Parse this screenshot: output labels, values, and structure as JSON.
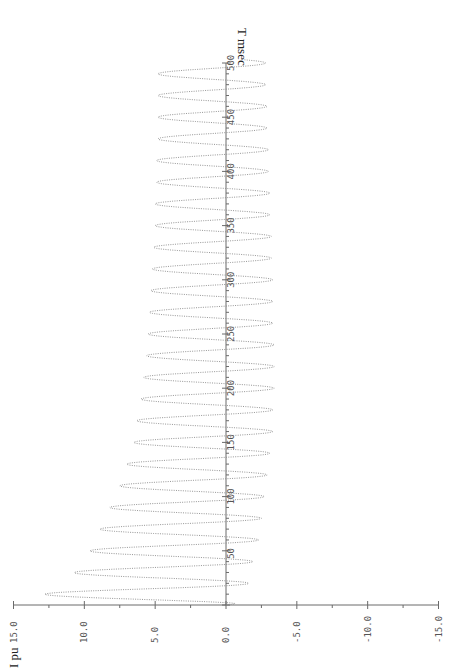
{
  "chart_data": {
    "type": "line",
    "orientation": "rotated-90 (time axis vertical upward, current axis horizontal with positive to the left)",
    "title": "",
    "xlabel": "T msec",
    "ylabel": "I pu",
    "xlim": [
      0,
      500
    ],
    "ylim": [
      -15,
      15
    ],
    "x_ticks": [
      50,
      100,
      150,
      200,
      250,
      300,
      350,
      400,
      450,
      500
    ],
    "x_tick_labels": [
      "50",
      "100",
      "150",
      "200",
      "250",
      "300",
      "350",
      "400",
      "450",
      "500"
    ],
    "y_ticks": [
      15,
      10,
      5,
      0,
      -5,
      -10,
      -15
    ],
    "y_tick_labels": [
      "15.0",
      "10.0",
      "5.0",
      "0.0",
      "-5.0",
      "-10.0",
      "-15.0"
    ],
    "grid": false,
    "legend": null,
    "line_style": "dotted",
    "frequency_hz": 50,
    "series": [
      {
        "name": "I",
        "positive_peaks": {
          "t": [
            10,
            30,
            50,
            70,
            90,
            110,
            130,
            150,
            170,
            190,
            210,
            230,
            250,
            270,
            290,
            310,
            330,
            350,
            370,
            390,
            410,
            430,
            450,
            470,
            490
          ],
          "i": [
            12.8,
            10.7,
            9.6,
            8.9,
            8.2,
            7.5,
            7.0,
            6.5,
            6.3,
            6.0,
            5.8,
            5.6,
            5.5,
            5.4,
            5.3,
            5.2,
            5.1,
            5.0,
            5.0,
            4.9,
            4.9,
            4.8,
            4.8,
            4.8,
            4.8
          ]
        },
        "negative_peaks": {
          "t": [
            20,
            40,
            60,
            80,
            100,
            120,
            140,
            160,
            180,
            200,
            220,
            240,
            260,
            280,
            300,
            320,
            340,
            360,
            380,
            400,
            420,
            440,
            460,
            480,
            500
          ],
          "i": [
            -1.6,
            -1.9,
            -2.3,
            -2.5,
            -2.7,
            -2.9,
            -3.1,
            -3.3,
            -3.3,
            -3.4,
            -3.4,
            -3.4,
            -3.3,
            -3.3,
            -3.3,
            -3.2,
            -3.2,
            -3.1,
            -3.1,
            -3.0,
            -3.0,
            -2.9,
            -2.9,
            -2.8,
            -2.8
          ]
        }
      }
    ],
    "model": {
      "ac_amplitude": 3.9,
      "dc_initial": 10.0,
      "dc_final": 0.9,
      "tau_ms": 90
    }
  },
  "labels": {
    "time_axis_title": "T msec",
    "current_axis_title": "I pu"
  }
}
